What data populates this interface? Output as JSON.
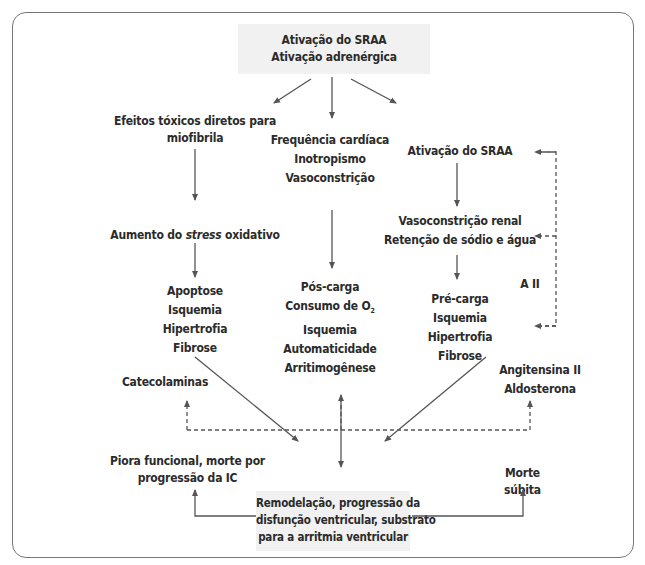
{
  "diagram": {
    "top_box": {
      "lines": [
        "Ativação do SRAA",
        "Ativação adrenérgica"
      ]
    },
    "left_col": {
      "n1": [
        "Efeitos tóxicos diretos para",
        "miofibrila"
      ],
      "n2_prefix": "Aumento do ",
      "n2_italic": "stress",
      "n2_suffix": " oxidativo",
      "n3": [
        "Apoptose",
        "Isquemia",
        "Hipertrofia",
        "Fibrose"
      ]
    },
    "center_col": {
      "n1": [
        "Frequência cardíaca",
        "Inotropismo",
        "Vasoconstrição"
      ],
      "n2": [
        "Pós-carga",
        "Consumo de O",
        "Isquemia",
        "Automaticidade",
        "Arritimogênese"
      ],
      "n2_subscript": "2"
    },
    "right_col": {
      "n1": "Ativação do SRAA",
      "n2": [
        "Vasoconstrição renal",
        "Retenção de sódio e água"
      ],
      "n3": [
        "Pré-carga",
        "Isquemia",
        "Hipertrofia",
        "Fibrose"
      ]
    },
    "feedback_label": "A II",
    "catecolaminas": "Catecolaminas",
    "angio_aldo": [
      "Angitensina II",
      "Aldosterona"
    ],
    "outcome_left": [
      "Piora funcional, morte por",
      "progressão da IC"
    ],
    "outcome_right": [
      "Morte",
      "súbita"
    ],
    "bottom_box": {
      "lines": [
        "Remodelação, progressão da",
        "disfunção ventricular, substrato",
        "para a arritmia ventricular"
      ]
    },
    "colors": {
      "arrow": "#555555",
      "box_fill": "#f1f1f1",
      "frame": "#777777",
      "text": "#2b2b2b"
    }
  }
}
